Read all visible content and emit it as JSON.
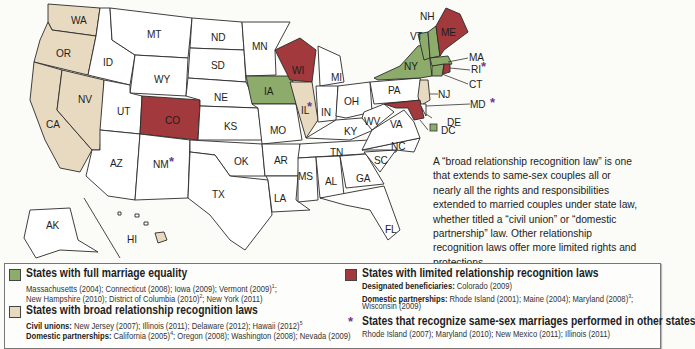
{
  "colors": {
    "full_marriage": "#8dac6c",
    "broad_recognition": "#e8dac0",
    "limited_recognition": "#a2393c",
    "none": "#ffffff",
    "asterisk": "#6b3a8f"
  },
  "states": {
    "WA": "WA",
    "OR": "OR",
    "CA": "CA",
    "NV": "NV",
    "ID": "ID",
    "MT": "MT",
    "WY": "WY",
    "UT": "UT",
    "CO": "CO",
    "AZ": "AZ",
    "NM": "NM",
    "ND": "ND",
    "SD": "SD",
    "NE": "NE",
    "KS": "KS",
    "OK": "OK",
    "TX": "TX",
    "MN": "MN",
    "IA": "IA",
    "MO": "MO",
    "AR": "AR",
    "LA": "LA",
    "WI": "WI",
    "IL": "IL",
    "MI": "MI",
    "IN": "IN",
    "OH": "OH",
    "KY": "KY",
    "TN": "TN",
    "MS": "MS",
    "AL": "AL",
    "GA": "GA",
    "FL": "FL",
    "SC": "SC",
    "NC": "NC",
    "VA": "VA",
    "WV": "WV",
    "PA": "PA",
    "NY": "NY",
    "VT": "VT",
    "NH": "NH",
    "ME": "ME",
    "MA": "MA",
    "RI": "RI",
    "CT": "CT",
    "NJ": "NJ",
    "DE": "DE",
    "MD": "MD",
    "DC": "DC",
    "AK": "AK",
    "HI": "HI"
  },
  "asterisk_symbol": "*",
  "note": "A “broad relationship recognition law” is one that extends to same-sex couples all or nearly all the rights and responsibilities extended to married couples under state law, whether titled a “civil union” or “domestic partnership” law. Other relationship recognition laws offer more limited rights and protections.",
  "legend": {
    "full": {
      "title": "States with full marriage equality",
      "line1": "Massachusetts (2004); Connecticut (2008); Iowa (2009); Vermont (2009)",
      "line1_sup": "1",
      "line1_end": ";",
      "line2a": "New Hampshire (2010); District of Columbia (2010)",
      "line2_sup": "2",
      "line2b": "; New York (2011)"
    },
    "broad": {
      "title": "States with broad relationship recognition laws",
      "civil_label": "Civil unions:",
      "civil_text": " New Jersey (2007); Illinois (2011); Delaware (2012); Hawaii (2012)",
      "civil_sup": "5",
      "dp_label": "Domestic partnerships:",
      "dp_text_a": " California (2005)",
      "dp_sup": "4",
      "dp_text_b": "; Oregon (2008); Washington (2008); Nevada (2009)"
    },
    "limited": {
      "title": "States with limited relationship recognition laws",
      "db_label": "Designated beneficiaries:",
      "db_text": " Colorado (2009)",
      "dp_label": "Domestic partnerships:",
      "dp_text": " Rhode Island (2001); Maine (2004); Maryland (2008)",
      "dp_sup": "3",
      "dp_end": ";",
      "dp_line2": "Wisconsin (2009)"
    },
    "recognize": {
      "symbol": "*",
      "title": "States that recognize same-sex marriages performed in other states",
      "text": "Rhode Island (2007); Maryland (2010); New Mexico (2011); Illinois (2011)"
    }
  }
}
